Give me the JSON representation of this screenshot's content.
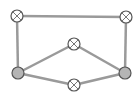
{
  "diagram": {
    "type": "graph",
    "colors": {
      "background": "#ffffff",
      "edge": "#9a9a9a",
      "node_stroke": "#555555",
      "node_fill_empty": "#ffffff",
      "node_fill_filled": "#b5b5b5",
      "cross": "#777777"
    },
    "nodes": [
      {
        "id": "top-left",
        "x": 17,
        "y": 16,
        "style": "crossed"
      },
      {
        "id": "top-right",
        "x": 126,
        "y": 17,
        "style": "crossed"
      },
      {
        "id": "middle-top",
        "x": 74,
        "y": 44,
        "style": "crossed"
      },
      {
        "id": "bottom-left",
        "x": 18,
        "y": 73,
        "style": "filled"
      },
      {
        "id": "bottom-right",
        "x": 125,
        "y": 73,
        "style": "filled"
      },
      {
        "id": "bottom-middle",
        "x": 74,
        "y": 85,
        "style": "crossed"
      }
    ],
    "edges": [
      {
        "from": "top-left",
        "to": "top-right"
      },
      {
        "from": "top-left",
        "to": "bottom-left"
      },
      {
        "from": "top-right",
        "to": "bottom-right"
      },
      {
        "from": "bottom-left",
        "to": "middle-top"
      },
      {
        "from": "middle-top",
        "to": "bottom-right"
      },
      {
        "from": "bottom-left",
        "to": "bottom-middle"
      },
      {
        "from": "bottom-middle",
        "to": "bottom-right"
      }
    ]
  }
}
